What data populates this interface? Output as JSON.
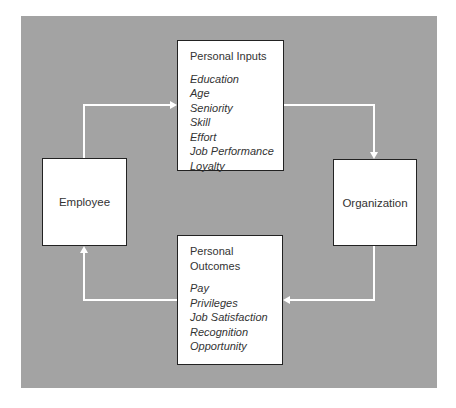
{
  "diagram": {
    "type": "cycle-flow",
    "background_color": "#a3a3a3",
    "nodes": {
      "employee": {
        "label": "Employee"
      },
      "organization": {
        "label": "Organization"
      },
      "personal_inputs": {
        "title": "Personal Inputs",
        "items": [
          "Education",
          "Age",
          "Seniority",
          "Skill",
          "Effort",
          "Job Performance",
          "Loyalty"
        ]
      },
      "personal_outcomes": {
        "title_line1": "Personal",
        "title_line2": "Outcomes",
        "items": [
          "Pay",
          "Privileges",
          "Job Satisfaction",
          "Recognition",
          "Opportunity"
        ]
      }
    },
    "edges": [
      {
        "from": "Employee",
        "to": "Personal Inputs"
      },
      {
        "from": "Personal Inputs",
        "to": "Organization"
      },
      {
        "from": "Organization",
        "to": "Personal Outcomes"
      },
      {
        "from": "Personal Outcomes",
        "to": "Employee"
      }
    ]
  }
}
